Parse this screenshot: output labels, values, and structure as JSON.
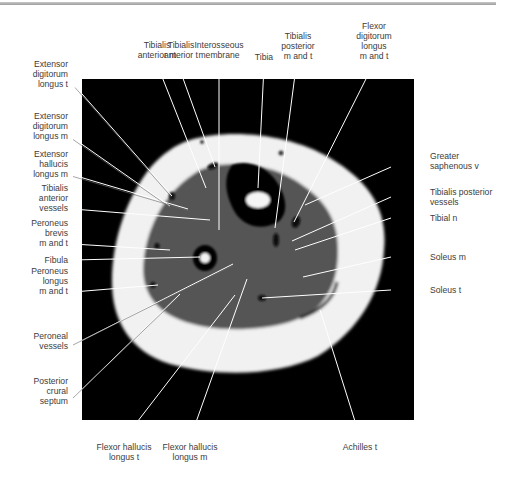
{
  "figure": {
    "type": "axial MRI cross-section of lower leg (calf)",
    "colors": {
      "background": "#000000",
      "fat": "#f2f2f2",
      "muscle": "#555555",
      "cortex": "#050505",
      "marrow": "#f4f4f4",
      "leader": "#ffffff"
    }
  },
  "labels": {
    "top": [
      {
        "id": "tibialis-anterior-m",
        "text": "Tibialis\nanterior m"
      },
      {
        "id": "tibialis-anterior-t",
        "text": "Tibialis\nanterior t"
      },
      {
        "id": "interosseous-membrane",
        "text": "Interosseous\nmembrane"
      },
      {
        "id": "tibia",
        "text": "Tibia"
      },
      {
        "id": "tibialis-posterior-m-and-t",
        "text": "Tibialis\nposterior\nm and t"
      },
      {
        "id": "flexor-digitorum-longus-m-and-t",
        "text": "Flexor\ndigitorum\nlongus\nm and t"
      }
    ],
    "left": [
      {
        "id": "extensor-digitorum-longus-t",
        "text": "Extensor\ndigitorum\nlongus t"
      },
      {
        "id": "extensor-digitorum-longus-m",
        "text": "Extensor\ndigitorum\nlongus m"
      },
      {
        "id": "extensor-hallucis-longus-m",
        "text": "Extensor\nhallucis\nlongus m"
      },
      {
        "id": "tibialis-anterior-vessels",
        "text": "Tibialis\nanterior\nvessels"
      },
      {
        "id": "peroneus-brevis-m-and-t",
        "text": "Peroneus\nbrevis\nm and t"
      },
      {
        "id": "fibula",
        "text": "Fibula"
      },
      {
        "id": "peroneus-longus-m-and-t",
        "text": "Peroneus\nlongus\nm and t"
      },
      {
        "id": "peroneal-vessels",
        "text": "Peroneal\nvessels"
      },
      {
        "id": "posterior-crural-septum",
        "text": "Posterior\ncrural\nseptum"
      }
    ],
    "right": [
      {
        "id": "greater-saphenous-v",
        "text": "Greater\nsaphenous v"
      },
      {
        "id": "tibialis-posterior-vessels",
        "text": "Tibialis posterior\nvessels"
      },
      {
        "id": "tibial-n",
        "text": "Tibial n"
      },
      {
        "id": "soleus-m",
        "text": "Soleus m"
      },
      {
        "id": "soleus-t",
        "text": "Soleus t"
      }
    ],
    "bottom": [
      {
        "id": "flexor-hallucis-longus-t",
        "text": "Flexor hallucis\nlongus t"
      },
      {
        "id": "flexor-hallucis-longus-m",
        "text": "Flexor hallucis\nlongus m"
      },
      {
        "id": "achilles-t",
        "text": "Achilles t"
      }
    ]
  }
}
